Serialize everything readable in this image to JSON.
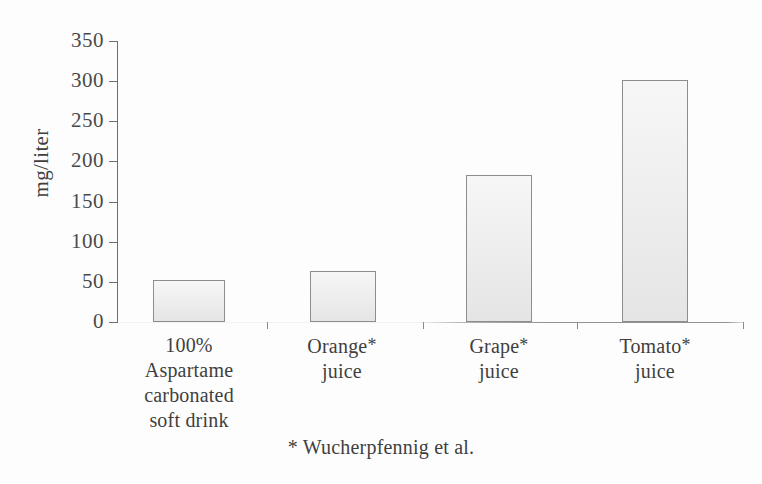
{
  "chart_data": {
    "type": "bar",
    "title": "",
    "subtitle": "",
    "xlabel": "",
    "ylabel": "mg/liter",
    "ylim": [
      0,
      350
    ],
    "yticks": [
      0,
      50,
      100,
      150,
      200,
      250,
      300,
      350
    ],
    "grid": false,
    "legend": "none",
    "categories": [
      "100% Aspartame carbonated soft drink",
      "Orange* juice",
      "Grape* juice",
      "Tomato* juice"
    ],
    "category_lines": [
      [
        "100%",
        "Aspartame",
        "carbonated",
        "soft drink"
      ],
      [
        "Orange*",
        "juice"
      ],
      [
        "Grape*",
        "juice"
      ],
      [
        "Tomato*",
        "juice"
      ]
    ],
    "values": [
      52,
      63,
      183,
      302
    ],
    "annotations": [
      "* Wucherpfennig et al."
    ],
    "bar_fill_color": "#ededed",
    "bar_border_color": "#8d8d8d",
    "axis_color": "#6f6f6f",
    "text_color": "#3f3f3f",
    "background_color": "#fdfdfd"
  },
  "axis": {
    "y_title": "mg/liter",
    "tick_labels": [
      "350",
      "300",
      "250",
      "200",
      "150",
      "100",
      "50",
      "0"
    ]
  },
  "footnote": {
    "text": "* Wucherpfennig et al."
  }
}
